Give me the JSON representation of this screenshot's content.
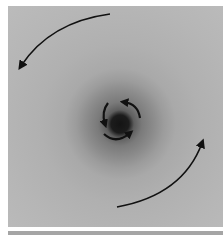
{
  "figure": {
    "arrows": [
      {
        "name": "outer-arrow-top-left",
        "direction": "counterclockwise"
      },
      {
        "name": "outer-arrow-bottom-right",
        "direction": "counterclockwise"
      },
      {
        "name": "inner-arrow-left",
        "direction": "counterclockwise"
      },
      {
        "name": "inner-arrow-top-right",
        "direction": "counterclockwise"
      },
      {
        "name": "inner-arrow-bottom",
        "direction": "counterclockwise"
      }
    ],
    "colors": {
      "background": "#b6b6b6",
      "halo": "#7a7a7a",
      "core": "#141414",
      "arrow": "#111111"
    }
  }
}
